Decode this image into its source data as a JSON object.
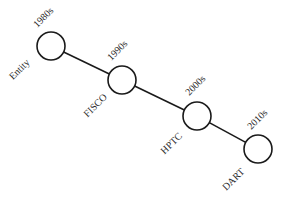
{
  "diagram": {
    "type": "timeline",
    "stroke_color": "#1a1a1a",
    "nodes": [
      {
        "name": "Entity",
        "decade": "1980s",
        "cx": 51,
        "cy": 46,
        "r": 14,
        "decade_pos": [
          44,
          18
        ],
        "name_pos": [
          20,
          70
        ]
      },
      {
        "name": "FISCO",
        "decade": "1990s",
        "cx": 122,
        "cy": 80,
        "r": 14,
        "decade_pos": [
          118,
          51
        ],
        "name_pos": [
          96,
          106
        ]
      },
      {
        "name": "HPTC",
        "decade": "2000s",
        "cx": 197,
        "cy": 116,
        "r": 14,
        "decade_pos": [
          196,
          86
        ],
        "name_pos": [
          172,
          144
        ]
      },
      {
        "name": "DART",
        "decade": "2010s",
        "cx": 258,
        "cy": 149,
        "r": 14,
        "decade_pos": [
          258,
          120
        ],
        "name_pos": [
          234,
          180
        ]
      }
    ]
  }
}
